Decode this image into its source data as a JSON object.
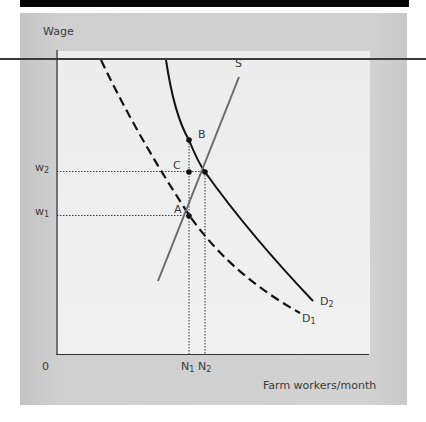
{
  "diagram": {
    "y_axis_label": "Wage",
    "x_axis_label": "Farm workers/month",
    "origin_label": "0",
    "curves": [
      {
        "name": "S",
        "label": "S",
        "style": "solid-gray"
      },
      {
        "name": "D1",
        "label": "D",
        "sub": "1",
        "style": "dashed-black"
      },
      {
        "name": "D2",
        "label": "D",
        "sub": "2",
        "style": "solid-black"
      }
    ],
    "points": [
      {
        "label": "A"
      },
      {
        "label": "B"
      },
      {
        "label": "C"
      }
    ],
    "y_ticks": [
      {
        "label": "w",
        "sub": "2"
      },
      {
        "label": "w",
        "sub": "1"
      }
    ],
    "x_ticks": [
      {
        "label": "N",
        "sub": "1"
      },
      {
        "label": "N",
        "sub": "2"
      }
    ],
    "colors": {
      "supply": "#6a6a6a",
      "demand": "#111111",
      "guides": "#222222"
    }
  }
}
